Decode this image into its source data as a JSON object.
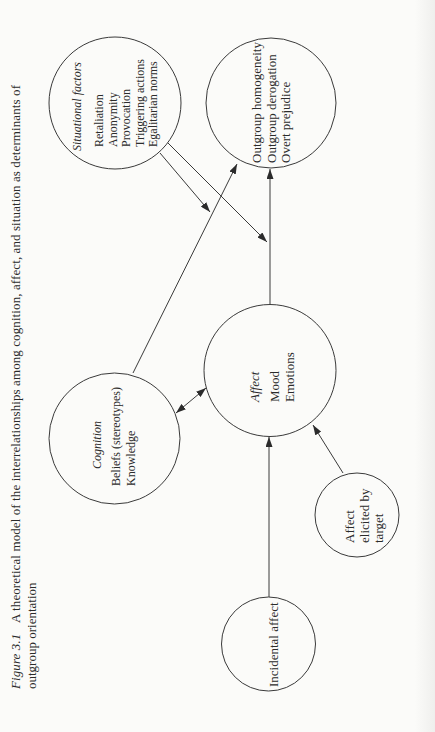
{
  "caption": {
    "label": "Figure 3.1",
    "line1": "A theoretical model of the interrelationships among cognition, affect, and situation as determinants of",
    "line2": "outgroup orientation"
  },
  "nodes": {
    "situational": {
      "title": "Situational factors",
      "items": [
        "Retaliation",
        "Anonymity",
        "Provocation",
        "Triggering actions",
        "Egalitarian norms"
      ]
    },
    "outcome": {
      "items": [
        "Outgroup homogeneity",
        "Outgroup derogation",
        "Overt prejudice"
      ]
    },
    "cognition": {
      "title": "Cognition",
      "items": [
        "Beliefs (stereotypes)",
        "Knowledge"
      ]
    },
    "affect": {
      "title": "Affect",
      "items": [
        "Mood",
        "Emotions"
      ]
    },
    "affect_elicited": {
      "lines": [
        "Affect",
        "elicited by",
        "target"
      ]
    },
    "incidental": {
      "label": "Incidental affect"
    }
  },
  "edges": [
    {
      "from": "cognition",
      "to": "outcome",
      "type": "arrow"
    },
    {
      "from": "affect",
      "to": "outcome",
      "type": "arrow"
    },
    {
      "from": "situational",
      "to": "cognition-outcome path",
      "type": "arrow"
    },
    {
      "from": "situational",
      "to": "affect-outcome path",
      "type": "arrow"
    },
    {
      "from": "cognition",
      "to": "affect",
      "type": "bidirectional"
    },
    {
      "from": "affect_elicited",
      "to": "affect",
      "type": "arrow"
    },
    {
      "from": "incidental",
      "to": "affect",
      "type": "arrow"
    }
  ],
  "colors": {
    "ink": "#2b2b2b",
    "background": "#fbfbf9"
  }
}
